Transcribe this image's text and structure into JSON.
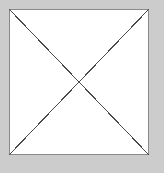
{
  "canvas": {
    "width": 164,
    "height": 173,
    "background_color": "#cccccc",
    "label": "placeholder-canvas"
  },
  "figure": {
    "name": "crossed-box-placeholder",
    "fill_color": "#ffffff",
    "border_color": "#8a8a8a",
    "border_width": 1,
    "diagonal_color": "#4a4a4a",
    "diagonal_width": 1,
    "rect": {
      "x": 9,
      "y": 9,
      "width": 140,
      "height": 146
    },
    "corners": {
      "top_left": [
        9,
        9
      ],
      "top_right": [
        149,
        9
      ],
      "bottom_right": [
        149,
        155
      ],
      "bottom_left": [
        9,
        155
      ]
    },
    "diagonals": [
      {
        "name": "diagonal-tl-br",
        "from": [
          9,
          9
        ],
        "to": [
          149,
          155
        ]
      },
      {
        "name": "diagonal-tr-bl",
        "from": [
          149,
          9
        ],
        "to": [
          9,
          155
        ]
      }
    ],
    "intersection_point": [
      79,
      82
    ]
  }
}
